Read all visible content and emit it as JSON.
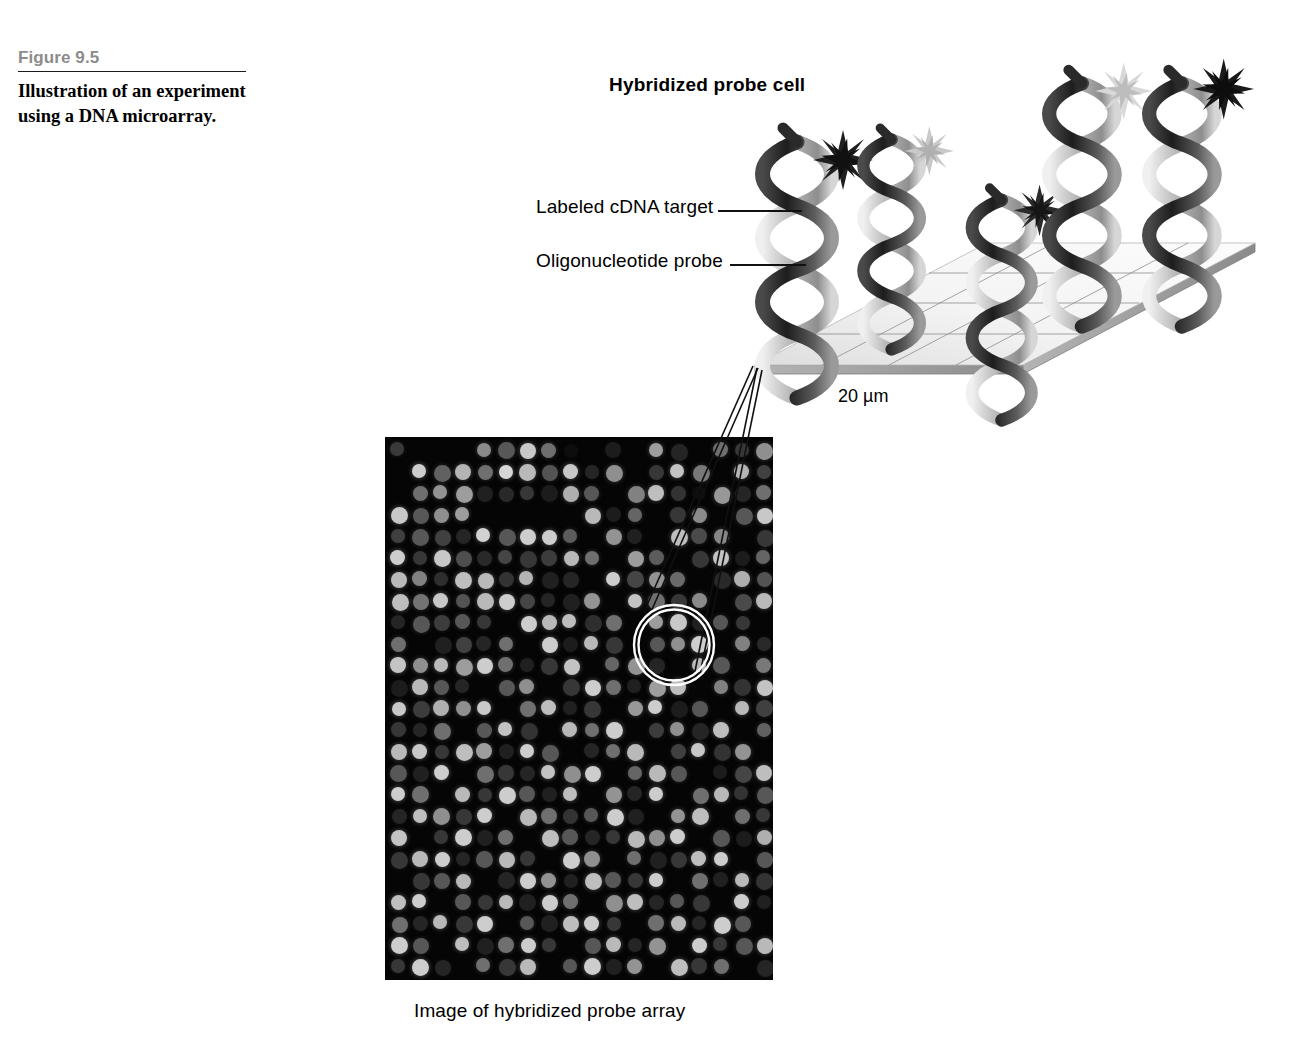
{
  "figure": {
    "number": "Figure 9.5",
    "caption": "Illustration of an experiment using a DNA microarray."
  },
  "panel": {
    "title": "Hybridized probe cell",
    "scale_label": "20 µm"
  },
  "callouts": [
    {
      "name": "labeled-cdna-target",
      "label": "Labeled cDNA target"
    },
    {
      "name": "oligonucleotide-probe",
      "label": "Oligonucleotide probe"
    }
  ],
  "array": {
    "caption": "Image of hybridized probe array",
    "background": "#050505",
    "columns": 18,
    "rows": 25,
    "spot_spacing_px": 21.5,
    "spot_diameter_px": 15
  },
  "colors": {
    "figure_number": "#8c8c8c",
    "rule": "#1a1a1a",
    "text": "#000000",
    "slab_top": "#f2f2f2",
    "slab_edge": "#9a9a9a",
    "grid_line": "#888888",
    "callout_line": "#111111",
    "zoom_circle": "#ffffff"
  },
  "chart_data": {
    "type": "heatmap",
    "title": "Image of hybridized probe array",
    "xlabel": "",
    "ylabel": "",
    "colormap": "grayscale (black = no signal, white = strong signal)",
    "cell_shape": "circle",
    "intensity_range": [
      0,
      255
    ],
    "values": [
      [
        62,
        8,
        10,
        6,
        150,
        95,
        200,
        120,
        14,
        8,
        30,
        12,
        170,
        40,
        9,
        120,
        60,
        155
      ],
      [
        8,
        205,
        105,
        180,
        120,
        215,
        185,
        90,
        200,
        40,
        155,
        12,
        60,
        195,
        130,
        10,
        180,
        70
      ],
      [
        10,
        120,
        160,
        170,
        35,
        45,
        60,
        30,
        175,
        95,
        8,
        140,
        190,
        55,
        14,
        165,
        40,
        120
      ],
      [
        200,
        95,
        155,
        170,
        9,
        8,
        12,
        10,
        10,
        185,
        30,
        110,
        8,
        60,
        150,
        12,
        95,
        200
      ],
      [
        70,
        95,
        70,
        40,
        210,
        95,
        205,
        205,
        100,
        8,
        160,
        35,
        12,
        190,
        80,
        145,
        10,
        60
      ],
      [
        205,
        60,
        200,
        85,
        45,
        75,
        60,
        65,
        185,
        120,
        9,
        170,
        100,
        8,
        60,
        195,
        30,
        110
      ],
      [
        185,
        140,
        50,
        190,
        185,
        55,
        180,
        35,
        40,
        12,
        205,
        75,
        160,
        115,
        8,
        45,
        175,
        90
      ],
      [
        190,
        125,
        200,
        90,
        185,
        205,
        75,
        40,
        35,
        160,
        8,
        195,
        120,
        60,
        150,
        12,
        80,
        185
      ],
      [
        40,
        95,
        65,
        95,
        60,
        9,
        205,
        185,
        190,
        50,
        120,
        8,
        170,
        200,
        35,
        95,
        60,
        12
      ],
      [
        120,
        9,
        35,
        70,
        40,
        120,
        9,
        205,
        30,
        185,
        60,
        12,
        95,
        155,
        205,
        8,
        140,
        45
      ],
      [
        195,
        155,
        185,
        170,
        205,
        120,
        35,
        60,
        195,
        8,
        110,
        160,
        40,
        12,
        185,
        95,
        10,
        130
      ],
      [
        30,
        185,
        95,
        40,
        9,
        95,
        155,
        8,
        60,
        205,
        120,
        35,
        170,
        190,
        8,
        140,
        55,
        195
      ],
      [
        200,
        65,
        175,
        155,
        200,
        8,
        120,
        190,
        35,
        60,
        9,
        165,
        205,
        30,
        95,
        12,
        185,
        70
      ],
      [
        60,
        40,
        120,
        10,
        95,
        195,
        55,
        12,
        185,
        120,
        205,
        8,
        65,
        155,
        40,
        190,
        9,
        105
      ],
      [
        185,
        200,
        60,
        190,
        170,
        35,
        205,
        95,
        8,
        40,
        120,
        185,
        12,
        70,
        200,
        55,
        160,
        9
      ],
      [
        95,
        35,
        205,
        8,
        120,
        60,
        40,
        195,
        155,
        205,
        9,
        110,
        185,
        95,
        12,
        30,
        75,
        190
      ],
      [
        205,
        120,
        9,
        185,
        60,
        205,
        95,
        35,
        190,
        12,
        160,
        40,
        205,
        8,
        120,
        185,
        55,
        95
      ],
      [
        40,
        190,
        155,
        60,
        205,
        8,
        185,
        120,
        55,
        95,
        205,
        35,
        9,
        160,
        190,
        12,
        120,
        60
      ],
      [
        195,
        9,
        60,
        205,
        35,
        120,
        12,
        190,
        95,
        40,
        60,
        185,
        155,
        205,
        8,
        95,
        30,
        175
      ],
      [
        60,
        185,
        205,
        40,
        95,
        185,
        60,
        9,
        205,
        155,
        12,
        120,
        35,
        60,
        190,
        205,
        8,
        95
      ],
      [
        8,
        60,
        95,
        185,
        12,
        40,
        205,
        160,
        35,
        190,
        95,
        60,
        205,
        9,
        120,
        35,
        185,
        55
      ],
      [
        190,
        205,
        8,
        95,
        60,
        185,
        35,
        205,
        120,
        9,
        155,
        190,
        40,
        95,
        60,
        12,
        205,
        35
      ],
      [
        120,
        40,
        185,
        60,
        205,
        9,
        95,
        35,
        190,
        205,
        60,
        8,
        120,
        185,
        40,
        205,
        95,
        12
      ],
      [
        205,
        95,
        12,
        190,
        35,
        120,
        205,
        60,
        8,
        95,
        185,
        40,
        160,
        12,
        205,
        60,
        95,
        185
      ],
      [
        60,
        205,
        40,
        9,
        120,
        60,
        185,
        12,
        95,
        205,
        35,
        160,
        8,
        190,
        60,
        120,
        9,
        40
      ]
    ]
  }
}
